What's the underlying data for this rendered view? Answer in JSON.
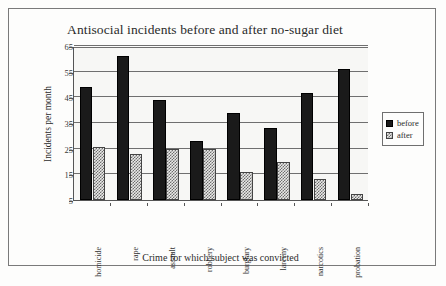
{
  "chart_data": {
    "type": "bar",
    "title": "Antisocial incidents before and after no-sugar diet",
    "xlabel": "Crime for which subject was convicted",
    "ylabel": "Incidents per month",
    "categories": [
      "homicide",
      "rape",
      "assault",
      "robbery",
      "burglary",
      "larceny",
      "narcotics",
      "probation"
    ],
    "series": [
      {
        "name": "before",
        "values": [
          49,
          61,
          44,
          28,
          39,
          33,
          46.5,
          56
        ],
        "color": "#1a1a1a"
      },
      {
        "name": "after",
        "values": [
          25.5,
          23,
          25,
          24.8,
          16,
          20,
          13,
          7.5
        ],
        "color": "#9a9a9a"
      }
    ],
    "ylim": [
      5,
      65
    ],
    "yticks": [
      5,
      15,
      25,
      35,
      45,
      55,
      65
    ],
    "ytick_labels": [
      "5",
      "15",
      "25",
      "35",
      "45",
      "55",
      "65"
    ],
    "grid": true,
    "legend_position": "right"
  },
  "legend": {
    "entries": [
      {
        "label": "before"
      },
      {
        "label": "after"
      }
    ]
  }
}
